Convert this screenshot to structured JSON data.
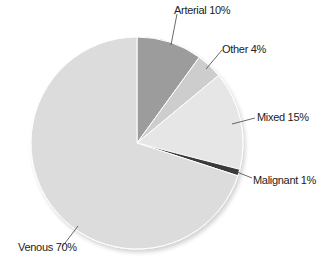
{
  "chart_data": {
    "type": "pie",
    "title": "",
    "categories": [
      "Arterial",
      "Other",
      "Mixed",
      "Malignant",
      "Venous"
    ],
    "values": [
      10,
      4,
      15,
      1,
      70
    ],
    "unit": "%",
    "colors": [
      "#9c9c9c",
      "#cdcdcd",
      "#e6e6e6",
      "#3a3a3a",
      "#dcdcdc"
    ],
    "labels": [
      "Arterial 10%",
      "Other 4%",
      "Mixed 15%",
      "Malignant 1%",
      "Venous 70%"
    ],
    "start_angle": "12 o'clock",
    "direction": "clockwise",
    "legend": "none (leader-line labels)"
  }
}
